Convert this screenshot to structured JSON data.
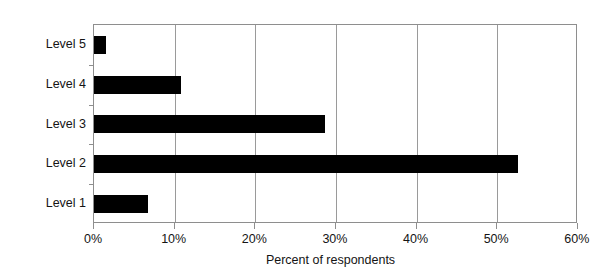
{
  "chart_data": {
    "type": "bar",
    "orientation": "horizontal",
    "title": "",
    "xlabel": "Percent of respondents",
    "ylabel": "",
    "categories": [
      "Level 1",
      "Level 2",
      "Level 3",
      "Level 4",
      "Level 5"
    ],
    "values": [
      6.7,
      52.8,
      28.7,
      10.8,
      1.5
    ],
    "series": [
      {
        "name": "Percent of respondents",
        "values": [
          6.7,
          52.8,
          28.7,
          10.8,
          1.5
        ]
      }
    ],
    "xlim": [
      0,
      60
    ],
    "ylim": [
      0,
      5
    ],
    "xticks": [
      0,
      10,
      20,
      30,
      40,
      50,
      60
    ],
    "xticklabels": [
      "0%",
      "10%",
      "20%",
      "30%",
      "40%",
      "50%",
      "60%"
    ],
    "grid": "vertical",
    "legend": "none",
    "bar_color": "#000000",
    "grid_color": "#9a9a9a",
    "axis_color": "#8e8e8e",
    "background_color": "#ffffff",
    "display_order_top_to_bottom": [
      "Level 5",
      "Level 4",
      "Level 3",
      "Level 2",
      "Level 1"
    ]
  },
  "axis": {
    "x_title": "Percent of respondents",
    "tick_labels": {
      "t0": "0%",
      "t1": "10%",
      "t2": "20%",
      "t3": "30%",
      "t4": "40%",
      "t5": "50%",
      "t6": "60%"
    },
    "category_labels": {
      "c5": "Level 5",
      "c4": "Level 4",
      "c3": "Level 3",
      "c2": "Level 2",
      "c1": "Level 1"
    }
  }
}
